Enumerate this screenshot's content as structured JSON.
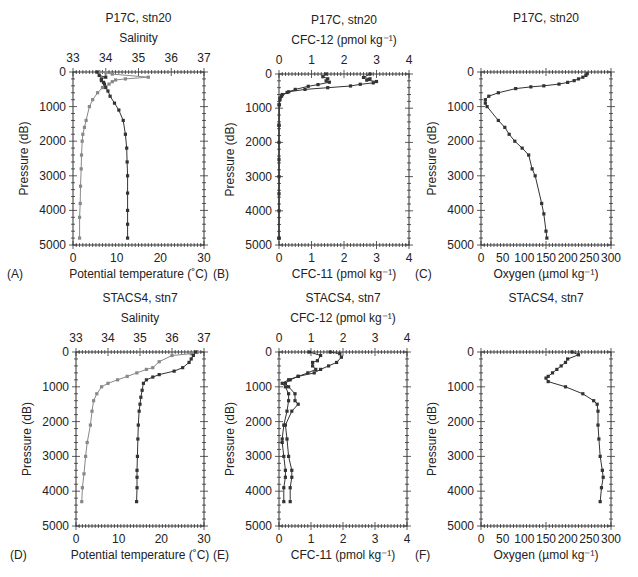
{
  "figure": {
    "layout": "2 rows x 3 columns of vertical ocean profiles",
    "pressure_axis": {
      "label": "Pressure (dB)",
      "range": [
        0,
        5000
      ],
      "ticks": [
        0,
        1000,
        2000,
        3000,
        4000,
        5000
      ],
      "inverted": true
    }
  },
  "chart_data": [
    {
      "panel": "(A)",
      "type": "line",
      "title": "P17C, stn20",
      "top_axis": {
        "label": "Salinity",
        "range": [
          33,
          37
        ],
        "ticks": [
          33,
          34,
          35,
          36,
          37
        ]
      },
      "bottom_axis": {
        "label": "Potential temperature (˚C)",
        "range": [
          0,
          30
        ],
        "ticks": [
          0,
          10,
          20,
          30
        ]
      },
      "ylabel": "Pressure (dB)",
      "ylim": [
        5000,
        0
      ],
      "series": [
        {
          "name": "Salinity",
          "axis": "top",
          "color": "#888888",
          "x": [
            33.8,
            34.0,
            34.2,
            35.3,
            34.6,
            34.3,
            34.2,
            34.1,
            33.9,
            33.75,
            33.6,
            33.5,
            33.4,
            33.35,
            33.3,
            33.28,
            33.26,
            33.25,
            33.23,
            33.22,
            33.2,
            33.2
          ],
          "y": [
            0,
            20,
            60,
            150,
            200,
            230,
            280,
            350,
            450,
            600,
            800,
            1000,
            1400,
            1600,
            1800,
            2000,
            2400,
            2800,
            3300,
            3800,
            4200,
            4800
          ]
        },
        {
          "name": "Potential temperature",
          "axis": "bottom",
          "color": "#333333",
          "x": [
            5.5,
            6.0,
            7.5,
            6.5,
            6.5,
            7.0,
            7.2,
            7.5,
            8.0,
            8.5,
            9.5,
            10.5,
            11.5,
            12.0,
            12.3,
            12.4,
            12.5,
            12.5,
            12.5,
            12.5,
            12.5
          ],
          "y": [
            0,
            100,
            150,
            200,
            250,
            300,
            350,
            450,
            550,
            700,
            900,
            1100,
            1400,
            1800,
            2200,
            2600,
            3000,
            3500,
            4000,
            4400,
            4800
          ]
        }
      ]
    },
    {
      "panel": "(B)",
      "type": "line",
      "title": "P17C, stn20",
      "top_axis": {
        "label": "CFC-12 (pmol kg⁻¹)",
        "range": [
          0,
          4
        ],
        "ticks": [
          0,
          1,
          2,
          3,
          4
        ]
      },
      "bottom_axis": {
        "label": "CFC-11 (pmol kg⁻¹)",
        "range": [
          0,
          4
        ],
        "ticks": [
          0,
          1,
          2,
          3,
          4
        ]
      },
      "ylabel": "Pressure (dB)",
      "ylim": [
        5000,
        0
      ],
      "series": [
        {
          "name": "CFC-12",
          "axis": "top",
          "color": "#333333",
          "x": [
            1.45,
            1.35,
            1.5,
            1.45,
            1.55,
            1.2,
            0.9,
            0.5,
            0.25,
            0.08,
            0.03,
            0.01,
            0.0,
            0.0,
            0.0,
            0.0,
            0.0
          ],
          "y": [
            0,
            80,
            140,
            200,
            240,
            310,
            360,
            450,
            540,
            650,
            750,
            900,
            1500,
            2000,
            3000,
            4000,
            4800
          ]
        },
        {
          "name": "CFC-11",
          "axis": "bottom",
          "color": "#333333",
          "x": [
            2.8,
            2.6,
            2.8,
            2.7,
            3.0,
            2.9,
            2.5,
            2.2,
            1.5,
            0.8,
            0.3,
            0.1,
            0.03,
            0.0,
            0.0,
            0.0,
            0.0,
            0.0
          ],
          "y": [
            0,
            100,
            140,
            180,
            220,
            260,
            300,
            350,
            400,
            450,
            520,
            600,
            700,
            900,
            1500,
            2500,
            3500,
            4800
          ]
        }
      ]
    },
    {
      "panel": "(C)",
      "type": "line",
      "title": "P17C, stn20",
      "bottom_axis": {
        "label": "Oxygen (µmol kg⁻¹)",
        "range": [
          0,
          300
        ],
        "ticks": [
          0,
          50,
          100,
          150,
          200,
          250,
          300
        ]
      },
      "ylabel": "Pressure (dB)",
      "ylim": [
        5000,
        0
      ],
      "series": [
        {
          "name": "Oxygen",
          "axis": "bottom",
          "color": "#333333",
          "x": [
            245,
            242,
            235,
            225,
            215,
            200,
            180,
            145,
            115,
            80,
            40,
            18,
            10,
            10,
            14,
            40,
            55,
            65,
            78,
            95,
            110,
            118,
            125,
            140,
            145,
            150,
            152
          ],
          "y": [
            50,
            100,
            150,
            200,
            250,
            300,
            350,
            400,
            430,
            480,
            600,
            700,
            800,
            900,
            1000,
            1400,
            1600,
            1800,
            2000,
            2200,
            2400,
            2800,
            3000,
            3800,
            4100,
            4600,
            4800
          ]
        }
      ]
    },
    {
      "panel": "(D)",
      "type": "line",
      "title": "STACS4, stn7",
      "top_axis": {
        "label": "Salinity",
        "range": [
          33,
          37
        ],
        "ticks": [
          33,
          34,
          35,
          36,
          37
        ]
      },
      "bottom_axis": {
        "label": "Potential temperature (˚C)",
        "range": [
          0,
          30
        ],
        "ticks": [
          0,
          10,
          20,
          30
        ]
      },
      "ylabel": "Pressure (dB)",
      "ylim": [
        5000,
        0
      ],
      "series": [
        {
          "name": "Salinity",
          "axis": "top",
          "color": "#888888",
          "x": [
            36.8,
            36.6,
            36.0,
            35.6,
            35.4,
            35.2,
            34.9,
            34.6,
            34.3,
            34.0,
            33.8,
            33.65,
            33.55,
            33.5,
            33.45,
            33.35,
            33.3,
            33.25,
            33.2,
            33.18
          ],
          "y": [
            0,
            50,
            100,
            280,
            450,
            500,
            600,
            700,
            800,
            900,
            1000,
            1200,
            1400,
            1700,
            2100,
            2600,
            3000,
            3500,
            3900,
            4300
          ]
        },
        {
          "name": "Potential temperature",
          "axis": "bottom",
          "color": "#333333",
          "x": [
            28.0,
            27.5,
            27.0,
            26.5,
            25.0,
            23.0,
            19.5,
            18.0,
            16.5,
            15.8,
            15.5,
            15.2,
            15.0,
            14.8,
            14.6,
            14.5,
            14.4,
            14.3,
            14.3,
            14.3,
            14.2
          ],
          "y": [
            0,
            100,
            200,
            300,
            450,
            550,
            650,
            720,
            800,
            900,
            1100,
            1300,
            1500,
            1700,
            2100,
            2500,
            3000,
            3400,
            3600,
            3900,
            4300
          ]
        }
      ]
    },
    {
      "panel": "(E)",
      "type": "line",
      "title": "STACS4, stn7",
      "top_axis": {
        "label": "CFC-12 (pmol kg⁻¹)",
        "range": [
          0,
          4
        ],
        "ticks": [
          0,
          1,
          2,
          3,
          4
        ]
      },
      "bottom_axis": {
        "label": "CFC-11 (pmol kg⁻¹)",
        "range": [
          0,
          4
        ],
        "ticks": [
          0,
          1,
          2,
          3,
          4
        ]
      },
      "ylabel": "Pressure (dB)",
      "ylim": [
        5000,
        0
      ],
      "series": [
        {
          "name": "CFC-12",
          "axis": "top",
          "color": "#333333",
          "x": [
            0.95,
            1.3,
            1.2,
            1.05,
            1.05,
            1.15,
            0.9,
            0.6,
            0.3,
            0.1,
            0.2,
            0.3,
            0.3,
            0.25,
            0.15,
            0.1,
            0.1,
            0.15,
            0.2,
            0.2,
            0.15,
            0.15
          ],
          "y": [
            0,
            100,
            250,
            300,
            400,
            500,
            600,
            700,
            800,
            900,
            1000,
            1200,
            1400,
            1700,
            2100,
            2500,
            2600,
            3000,
            3400,
            3600,
            3900,
            4300
          ]
        },
        {
          "name": "CFC-11",
          "axis": "bottom",
          "color": "#333333",
          "x": [
            1.6,
            1.9,
            1.95,
            1.8,
            1.55,
            1.3,
            1.1,
            0.6,
            0.35,
            0.2,
            0.3,
            0.5,
            0.5,
            0.6,
            0.4,
            0.2,
            0.25,
            0.3,
            0.4,
            0.4,
            0.35,
            0.35
          ],
          "y": [
            0,
            50,
            150,
            300,
            400,
            500,
            600,
            700,
            800,
            900,
            1000,
            1200,
            1400,
            1500,
            1700,
            2100,
            2500,
            3000,
            3400,
            3600,
            3900,
            4300
          ]
        }
      ]
    },
    {
      "panel": "(F)",
      "type": "line",
      "title": "STACS4, stn7",
      "bottom_axis": {
        "label": "Oxygen (µmol kg⁻¹)",
        "range": [
          0,
          300
        ],
        "ticks": [
          0,
          50,
          100,
          150,
          200,
          250,
          300
        ]
      },
      "ylabel": "Pressure (dB)",
      "ylim": [
        5000,
        0
      ],
      "series": [
        {
          "name": "Oxygen",
          "axis": "bottom",
          "color": "#333333",
          "x": [
            210,
            225,
            200,
            195,
            185,
            175,
            165,
            155,
            150,
            155,
            195,
            235,
            260,
            268,
            270,
            270,
            272,
            275,
            280,
            282,
            278,
            275
          ],
          "y": [
            0,
            80,
            200,
            300,
            400,
            500,
            600,
            700,
            750,
            850,
            1000,
            1200,
            1400,
            1500,
            1700,
            2100,
            2500,
            3000,
            3400,
            3600,
            3900,
            4300
          ]
        }
      ]
    }
  ]
}
